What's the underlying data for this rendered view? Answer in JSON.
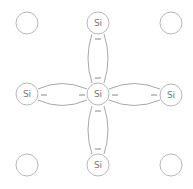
{
  "diagram": {
    "element_symbol": "Si",
    "colors": {
      "atom_stroke": "#b8b8b8",
      "bond_stroke": "#a8a8a8",
      "label": "#777777",
      "background": "#ffffff"
    },
    "atoms": [
      {
        "id": "corner-top-left",
        "label": ""
      },
      {
        "id": "top",
        "label": "Si"
      },
      {
        "id": "corner-top-right",
        "label": ""
      },
      {
        "id": "left",
        "label": "Si"
      },
      {
        "id": "center",
        "label": "Si"
      },
      {
        "id": "right",
        "label": "Si"
      },
      {
        "id": "corner-bottom-left",
        "label": ""
      },
      {
        "id": "bottom",
        "label": "Si"
      },
      {
        "id": "corner-bottom-right",
        "label": ""
      }
    ],
    "bonds": [
      {
        "from": "center",
        "to": "top",
        "electrons": [
          "−",
          "−"
        ]
      },
      {
        "from": "center",
        "to": "left",
        "electrons": [
          "−",
          "−"
        ]
      },
      {
        "from": "center",
        "to": "right",
        "electrons": [
          "−",
          "−"
        ]
      },
      {
        "from": "center",
        "to": "bottom",
        "electrons": [
          "−",
          "−"
        ]
      }
    ]
  }
}
